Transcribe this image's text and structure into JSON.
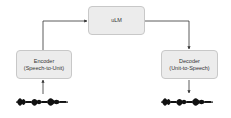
{
  "diagram": {
    "nodes": {
      "ulm": {
        "label": "uLM"
      },
      "encoder": {
        "title": "Encoder",
        "subtitle": "(Speech-to-Unit)"
      },
      "decoder": {
        "title": "Decoder",
        "subtitle": "(Unit-to-Speech)"
      }
    },
    "edges": [
      {
        "from": "input-waveform",
        "to": "encoder"
      },
      {
        "from": "encoder",
        "to": "ulm"
      },
      {
        "from": "ulm",
        "to": "decoder"
      },
      {
        "from": "decoder",
        "to": "output-waveform"
      }
    ],
    "colors": {
      "box_fill": "#ececec",
      "box_border": "#c8c8c8",
      "line": "#333333",
      "wave": "#111111"
    }
  }
}
